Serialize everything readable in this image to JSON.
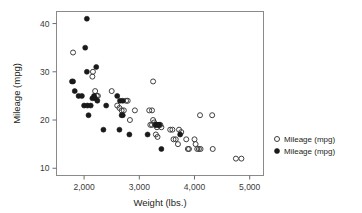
{
  "chart_data": {
    "type": "scatter",
    "title": "",
    "xlabel": "Weight (lbs.)",
    "ylabel": "Mileage (mpg)",
    "xlim": [
      1500,
      5250
    ],
    "ylim": [
      8.5,
      42.5
    ],
    "xticks": [
      2000,
      3000,
      4000,
      5000
    ],
    "xtick_labels": [
      "2,000",
      "3,000",
      "4,000",
      "5,000"
    ],
    "yticks": [
      10,
      20,
      30,
      40
    ],
    "ytick_labels": [
      "10",
      "20",
      "30",
      "40"
    ],
    "grid": false,
    "legend_position": "right",
    "series": [
      {
        "name": "Mileage (mpg)",
        "marker": "open-circle",
        "color": "#3f3f3f",
        "points": [
          [
            1800,
            34.0
          ],
          [
            2150,
            29.0
          ],
          [
            2160,
            30.0
          ],
          [
            2200,
            26.0
          ],
          [
            2230,
            25.0
          ],
          [
            2250,
            25.0
          ],
          [
            2500,
            26.0
          ],
          [
            2600,
            23.0
          ],
          [
            2640,
            22.5
          ],
          [
            2680,
            22.0
          ],
          [
            2720,
            22.0
          ],
          [
            2760,
            24.0
          ],
          [
            2790,
            24.0
          ],
          [
            2830,
            20.0
          ],
          [
            2920,
            22.0
          ],
          [
            3180,
            22.0
          ],
          [
            3230,
            22.0
          ],
          [
            3250,
            28.0
          ],
          [
            3200,
            19.0
          ],
          [
            3230,
            19.0
          ],
          [
            3250,
            20.0
          ],
          [
            3270,
            19.5
          ],
          [
            3290,
            19.0
          ],
          [
            3300,
            19.0
          ],
          [
            3320,
            18.5
          ],
          [
            3340,
            19.0
          ],
          [
            3360,
            19.0
          ],
          [
            3380,
            19.0
          ],
          [
            3400,
            18.5
          ],
          [
            3300,
            17.0
          ],
          [
            3330,
            16.5
          ],
          [
            3560,
            18.0
          ],
          [
            3600,
            18.0
          ],
          [
            3620,
            16.0
          ],
          [
            3660,
            16.0
          ],
          [
            3700,
            15.0
          ],
          [
            3720,
            18.0
          ],
          [
            3760,
            17.5
          ],
          [
            3850,
            16.0
          ],
          [
            3880,
            14.0
          ],
          [
            3900,
            14.0
          ],
          [
            4000,
            16.0
          ],
          [
            4020,
            15.0
          ],
          [
            4050,
            14.0
          ],
          [
            4080,
            14.0
          ],
          [
            4100,
            21.0
          ],
          [
            4110,
            14.0
          ],
          [
            4320,
            21.0
          ],
          [
            4330,
            14.0
          ],
          [
            4750,
            12.0
          ],
          [
            4850,
            12.0
          ]
        ]
      },
      {
        "name": "Mileage (mpg)",
        "marker": "filled-circle",
        "color": "#1a1a1a",
        "points": [
          [
            2050,
            41.0
          ],
          [
            2020,
            35.0
          ],
          [
            2050,
            30.0
          ],
          [
            2220,
            31.0
          ],
          [
            1780,
            28.0
          ],
          [
            1800,
            28.0
          ],
          [
            1830,
            26.0
          ],
          [
            1900,
            25.0
          ],
          [
            1960,
            25.0
          ],
          [
            2000,
            23.0
          ],
          [
            2060,
            23.0
          ],
          [
            2120,
            23.0
          ],
          [
            2150,
            24.5
          ],
          [
            2180,
            25.0
          ],
          [
            2200,
            24.5
          ],
          [
            2240,
            24.0
          ],
          [
            2080,
            21.0
          ],
          [
            2400,
            23.0
          ],
          [
            2350,
            18.0
          ],
          [
            2600,
            25.0
          ],
          [
            2650,
            24.0
          ],
          [
            2700,
            24.0
          ],
          [
            2680,
            21.0
          ],
          [
            2700,
            21.0
          ],
          [
            2640,
            18.0
          ],
          [
            2820,
            17.0
          ],
          [
            3150,
            17.0
          ],
          [
            3300,
            19.0
          ],
          [
            3340,
            19.0
          ],
          [
            3360,
            19.0
          ],
          [
            3400,
            14.0
          ],
          [
            3740,
            17.0
          ]
        ]
      }
    ]
  },
  "legend": {
    "items": [
      {
        "label": "Mileage (mpg)",
        "marker": "open-circle"
      },
      {
        "label": "Mileage (mpg)",
        "marker": "filled-circle"
      }
    ]
  }
}
